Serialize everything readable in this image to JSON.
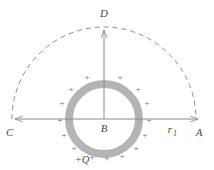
{
  "figure": {
    "type": "physics-diagram",
    "background_color": "#ffffff",
    "colors": {
      "ring": "#b3b3b8",
      "line": "#8a8a92",
      "dashed_arc": "#8a8a92",
      "text": "#4a4a4a",
      "plus": "#6a6a78"
    },
    "labels": {
      "top": "D",
      "left": "C",
      "right": "A",
      "center": "B",
      "radius_main": "r",
      "radius_sub": "1",
      "charge": "+Q"
    },
    "plus_symbol": "+",
    "geometry": {
      "center_x": 104,
      "center_y": 119,
      "ring_outer_radius": 39,
      "ring_inner_radius": 31,
      "arc_radius": 92,
      "axis_left_x": 12,
      "axis_right_x": 201,
      "axis_top_y": 27
    },
    "plus_positions": [
      {
        "x": 87,
        "y": 78
      },
      {
        "x": 120,
        "y": 78
      },
      {
        "x": 71,
        "y": 90
      },
      {
        "x": 138,
        "y": 90
      },
      {
        "x": 62,
        "y": 104
      },
      {
        "x": 147,
        "y": 104
      },
      {
        "x": 60,
        "y": 121
      },
      {
        "x": 149,
        "y": 121
      },
      {
        "x": 64,
        "y": 136
      },
      {
        "x": 145,
        "y": 136
      },
      {
        "x": 74,
        "y": 149
      },
      {
        "x": 136,
        "y": 149
      },
      {
        "x": 89,
        "y": 157
      },
      {
        "x": 120,
        "y": 157
      },
      {
        "x": 104,
        "y": 159
      }
    ],
    "elements": {
      "horizontal_axis_name": "horizontal-axis-CA",
      "vertical_axis_name": "vertical-axis-BD",
      "dashed_arc_name": "dashed-semicircle-arc",
      "ring_name": "charged-ring"
    }
  }
}
